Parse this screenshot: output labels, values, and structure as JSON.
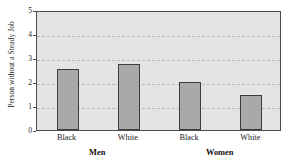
{
  "chart_data": {
    "type": "bar",
    "title": "",
    "xlabel": "",
    "ylabel": "Person without a Steady Job",
    "ylim": [
      0,
      5
    ],
    "yticks": [
      0,
      1,
      2,
      3,
      4,
      5
    ],
    "ytick_labels": [
      "0",
      "1",
      "2",
      "3",
      "4",
      "5"
    ],
    "grid": true,
    "legend": "none",
    "categories": [
      "Black",
      "White",
      "Black",
      "White"
    ],
    "groups": [
      {
        "label": "Men",
        "categories": [
          "Black",
          "White"
        ]
      },
      {
        "label": "Women",
        "categories": [
          "Black",
          "White"
        ]
      }
    ],
    "values": [
      2.55,
      2.75,
      2.0,
      1.45
    ],
    "bars": [
      {
        "group": "Men",
        "category": "Black",
        "value": 2.55
      },
      {
        "group": "Men",
        "category": "White",
        "value": 2.75
      },
      {
        "group": "Women",
        "category": "Black",
        "value": 2.0
      },
      {
        "group": "Women",
        "category": "White",
        "value": 1.45
      }
    ],
    "colors": {
      "bar_fill": "#a9a9a9",
      "bar_border": "#3d3d3d",
      "plot_background": "#e4e4e4",
      "gridline": "#b9b9b9",
      "axis": "#4a4a4a",
      "text": "#1a1a1a",
      "page_background": "#ffffff"
    }
  }
}
